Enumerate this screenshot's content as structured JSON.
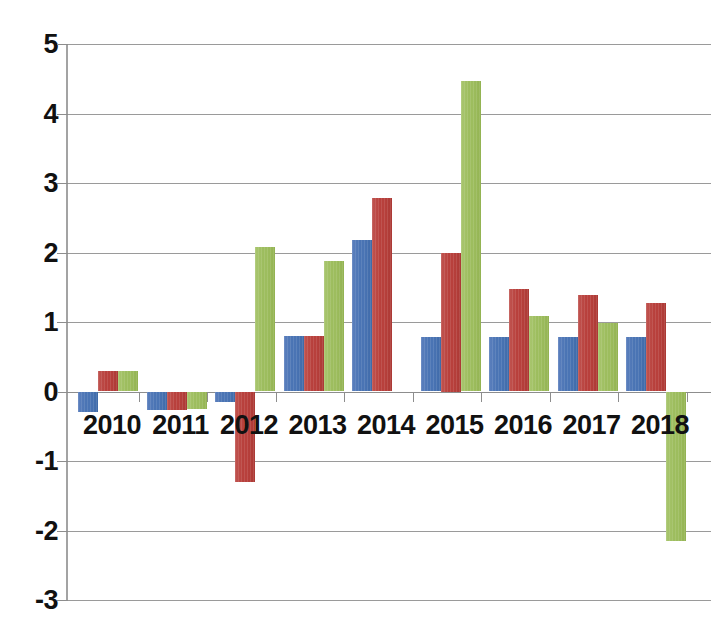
{
  "chart_data": {
    "type": "bar",
    "title": "",
    "xlabel": "",
    "ylabel": "",
    "categories": [
      "2010",
      "2011",
      "2012",
      "2013",
      "2014",
      "2015",
      "2016",
      "2017",
      "2018"
    ],
    "series": [
      {
        "name": "series-blue",
        "color": "#4a74b4",
        "values": [
          -0.29,
          -0.27,
          -0.15,
          0.8,
          2.18,
          0.78,
          0.78,
          0.78,
          0.78
        ]
      },
      {
        "name": "series-red",
        "color": "#b8403c",
        "values": [
          0.3,
          -0.26,
          -1.3,
          0.8,
          2.78,
          2.0,
          1.48,
          1.39,
          1.28
        ]
      },
      {
        "name": "series-green",
        "color": "#9dbd5e",
        "values": [
          0.3,
          -0.25,
          2.08,
          1.88,
          0.0,
          4.47,
          1.08,
          0.98,
          -2.15
        ]
      }
    ],
    "ylim": [
      -3,
      5
    ],
    "yticks": [
      5,
      4,
      3,
      2,
      1,
      0,
      -1,
      -2,
      -3
    ],
    "ytick_labels": [
      "5",
      "4",
      "3",
      "2",
      "1",
      "0",
      "-1",
      "-2",
      "-3"
    ],
    "grid": true,
    "legend": "none",
    "legend_position": "none",
    "annotations": []
  }
}
